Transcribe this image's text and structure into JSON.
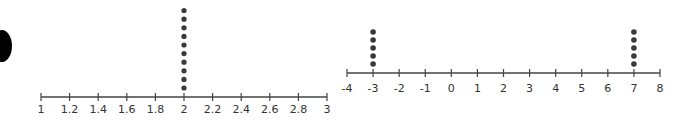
{
  "decoration": {
    "left_blob_color": "#000000"
  },
  "chart_data": [
    {
      "type": "scatter",
      "subtype": "dot-plot",
      "title": "",
      "xlabel": "",
      "ylabel": "",
      "xlim": [
        1,
        3
      ],
      "ticks": [
        1,
        1.2,
        1.4,
        1.6,
        1.8,
        2,
        2.2,
        2.4,
        2.6,
        2.8,
        3
      ],
      "tick_labels": [
        "1",
        "1.2",
        "1.4",
        "1.6",
        "1.8",
        "2",
        "2.2",
        "2.4",
        "2.6",
        "2.8",
        "3"
      ],
      "points": [
        {
          "x": 2,
          "count": 10
        }
      ],
      "grid": false,
      "color": "#3a3a3a"
    },
    {
      "type": "scatter",
      "subtype": "dot-plot",
      "title": "",
      "xlabel": "",
      "ylabel": "",
      "xlim": [
        -4,
        8
      ],
      "ticks": [
        -4,
        -3,
        -2,
        -1,
        0,
        1,
        2,
        3,
        4,
        5,
        6,
        7,
        8
      ],
      "tick_labels": [
        "-4",
        "-3",
        "-2",
        "-1",
        "0",
        "1",
        "2",
        "3",
        "4",
        "5",
        "6",
        "7",
        "8"
      ],
      "points": [
        {
          "x": -3,
          "count": 5
        },
        {
          "x": 7,
          "count": 5
        }
      ],
      "grid": false,
      "color": "#3a3a3a"
    }
  ]
}
